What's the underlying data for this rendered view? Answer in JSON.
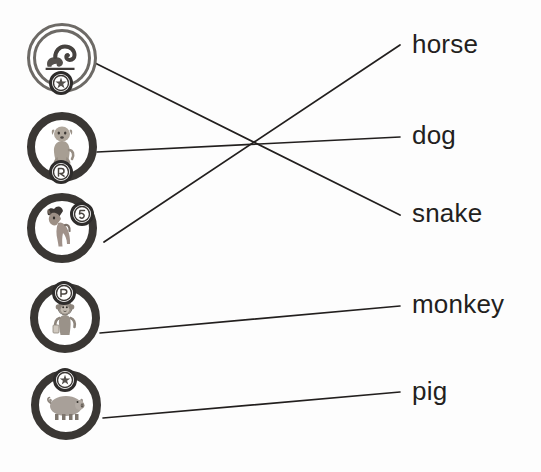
{
  "worksheet": {
    "type": "matching-exercise",
    "icon_count": 5,
    "label_count": 5
  },
  "icons": [
    {
      "id": "icon-snake",
      "animal": "snake",
      "icon_name": "snake-medallion-icon",
      "ring_style": "textured",
      "badge_position": "bottom",
      "x": 23,
      "y": 19,
      "anchor_x": 93,
      "anchor_y": 62
    },
    {
      "id": "icon-dog",
      "animal": "dog",
      "icon_name": "dog-medallion-icon",
      "ring_style": "solid",
      "badge_position": "bottom",
      "x": 23,
      "y": 108,
      "anchor_x": 97,
      "anchor_y": 152
    },
    {
      "id": "icon-horse",
      "animal": "horse",
      "icon_name": "horse-medallion-icon",
      "ring_style": "solid",
      "badge_position": "top-right",
      "x": 23,
      "y": 189,
      "anchor_x": 104,
      "anchor_y": 242
    },
    {
      "id": "icon-monkey",
      "animal": "monkey",
      "icon_name": "monkey-medallion-icon",
      "ring_style": "solid",
      "badge_position": "top",
      "x": 26,
      "y": 279,
      "anchor_x": 100,
      "anchor_y": 333
    },
    {
      "id": "icon-pig",
      "animal": "pig",
      "icon_name": "pig-medallion-icon",
      "ring_style": "solid",
      "badge_position": "top",
      "x": 27,
      "y": 366,
      "anchor_x": 103,
      "anchor_y": 418
    }
  ],
  "labels": [
    {
      "id": "label-horse",
      "text": "horse",
      "x": 412,
      "y": 31,
      "anchor_x": 400,
      "anchor_y": 45
    },
    {
      "id": "label-dog",
      "text": "dog",
      "x": 412,
      "y": 122,
      "anchor_x": 400,
      "anchor_y": 137
    },
    {
      "id": "label-snake",
      "text": "snake",
      "x": 412,
      "y": 200,
      "anchor_x": 400,
      "anchor_y": 215
    },
    {
      "id": "label-monkey",
      "text": "monkey",
      "x": 412,
      "y": 291,
      "anchor_x": 400,
      "anchor_y": 306
    },
    {
      "id": "label-pig",
      "text": "pig",
      "x": 412,
      "y": 378,
      "anchor_x": 400,
      "anchor_y": 392
    }
  ],
  "connections": [
    {
      "id": "line-snake-to-snake",
      "from": "icon-snake",
      "to": "label-snake",
      "x1": 93,
      "y1": 62,
      "x2": 400,
      "y2": 215
    },
    {
      "id": "line-dog-to-dog",
      "from": "icon-dog",
      "to": "label-dog",
      "x1": 97,
      "y1": 152,
      "x2": 400,
      "y2": 137
    },
    {
      "id": "line-horse-to-horse",
      "from": "icon-horse",
      "to": "label-horse",
      "x1": 104,
      "y1": 242,
      "x2": 400,
      "y2": 45
    },
    {
      "id": "line-monkey-to-monkey",
      "from": "icon-monkey",
      "to": "label-monkey",
      "x1": 100,
      "y1": 333,
      "x2": 400,
      "y2": 306
    },
    {
      "id": "line-pig-to-pig",
      "from": "icon-pig",
      "to": "label-pig",
      "x1": 103,
      "y1": 418,
      "x2": 400,
      "y2": 392
    }
  ],
  "colors": {
    "background": "#fdfdfd",
    "ink": "#231f20",
    "ring_dark": "#2e2c2b",
    "ring_textured": "#6d6a66",
    "animal_fill": "#9a948c"
  }
}
